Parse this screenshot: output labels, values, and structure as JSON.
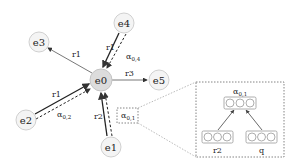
{
  "diagram": {
    "nodes": [
      {
        "id": "e0",
        "label": "e0",
        "x": 101,
        "y": 80,
        "highlight": true
      },
      {
        "id": "e1",
        "label": "e1",
        "x": 111,
        "y": 147
      },
      {
        "id": "e2",
        "label": "e2",
        "x": 26,
        "y": 120
      },
      {
        "id": "e3",
        "label": "e3",
        "x": 39,
        "y": 42
      },
      {
        "id": "e4",
        "label": "e4",
        "x": 124,
        "y": 23
      },
      {
        "id": "e5",
        "label": "e5",
        "x": 159,
        "y": 80
      }
    ],
    "edges": [
      {
        "from": "e0",
        "to": "e3",
        "relation": "r1"
      },
      {
        "from": "e4",
        "to": "e0",
        "relation": "r1",
        "attention": "α0,4"
      },
      {
        "from": "e0",
        "to": "e5",
        "relation": "r3"
      },
      {
        "from": "e2",
        "to": "e0",
        "relation": "r1",
        "attention": "α0,2"
      },
      {
        "from": "e1",
        "to": "e0",
        "relation": "r2",
        "attention": "α0,1"
      }
    ],
    "labels": {
      "r1_e3": "r1",
      "r1_e4": "r1",
      "r3_e5": "r3",
      "r1_e2": "r1",
      "r2_e1": "r2",
      "alpha04": "α",
      "alpha04_sub": "0,4",
      "alpha02": "α",
      "alpha02_sub": "0,2",
      "alpha01": "α",
      "alpha01_sub": "0,1"
    },
    "inset": {
      "title": "α",
      "title_sub": "0,1",
      "inputs": [
        "r2",
        "q"
      ]
    },
    "colors": {
      "node_fill": "#f4f4f4",
      "node_highlight_fill": "#dcdcdc",
      "node_stroke": "#d0d0d0",
      "edge": "#333333",
      "dashed_box": "#666666"
    }
  }
}
